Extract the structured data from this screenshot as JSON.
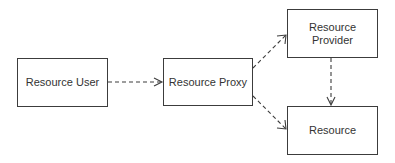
{
  "diagram": {
    "type": "flow",
    "background": "#ffffff",
    "stroke_color": "#3c3c3c",
    "text_color": "#333333",
    "nodes": [
      {
        "id": "resource-user",
        "label": "Resource User"
      },
      {
        "id": "resource-proxy",
        "label": "Resource Proxy"
      },
      {
        "id": "resource-provider",
        "label": "Resource\nProvider"
      },
      {
        "id": "resource",
        "label": "Resource"
      }
    ],
    "edges": [
      {
        "from": "resource-user",
        "to": "resource-proxy",
        "style": "dashed",
        "arrow": "open"
      },
      {
        "from": "resource-proxy",
        "to": "resource-provider",
        "style": "dashed",
        "arrow": "open"
      },
      {
        "from": "resource-proxy",
        "to": "resource",
        "style": "dashed",
        "arrow": "open"
      },
      {
        "from": "resource-provider",
        "to": "resource",
        "style": "dashed",
        "arrow": "open"
      }
    ]
  }
}
